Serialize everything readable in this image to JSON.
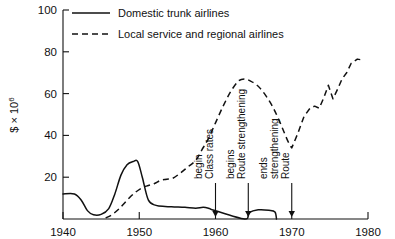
{
  "chart_data": {
    "type": "line",
    "title": "",
    "xlabel": "",
    "ylabel": "$ × 10⁶",
    "ylabel_parts": {
      "currency": "$",
      "times": "×",
      "base": "10",
      "exponent": "6"
    },
    "xlim": [
      1940,
      1980
    ],
    "ylim": [
      0,
      100
    ],
    "xticks": [
      1940,
      1950,
      1960,
      1970,
      1980
    ],
    "xtick_labels": [
      "1940",
      "1950",
      "1960",
      "1970",
      "1980"
    ],
    "yticks": [
      20,
      40,
      60,
      80,
      100
    ],
    "ytick_labels": [
      "20",
      "40",
      "60",
      "80",
      "100"
    ],
    "grid": false,
    "legend_position": "top-left-inside",
    "series": [
      {
        "name": "Domestic trunk airlines",
        "style": "solid",
        "x": [
          1940.0,
          1941.5,
          1942.4,
          1943.2,
          1944.0,
          1945.0,
          1946.0,
          1946.8,
          1947.6,
          1948.4,
          1949.2,
          1949.8,
          1950.4,
          1951.2,
          1952.2,
          1953.4,
          1954.6,
          1956.0,
          1957.4,
          1958.4,
          1959.2,
          1959.8,
          1963.8,
          1964.4,
          1965.6,
          1967.0,
          1967.8,
          1968.0
        ],
        "y": [
          12.0,
          12.0,
          9.0,
          4.0,
          2.0,
          2.2,
          5.0,
          12.0,
          21.0,
          26.0,
          27.5,
          27.5,
          20.0,
          9.0,
          6.5,
          6.0,
          5.8,
          5.6,
          5.2,
          5.6,
          5.0,
          4.2,
          0.0,
          3.0,
          4.4,
          4.2,
          3.4,
          0.0
        ]
      },
      {
        "name": "Local service and regional airlines",
        "style": "dashed",
        "x": [
          1945.6,
          1946.4,
          1947.4,
          1948.4,
          1949.4,
          1950.4,
          1951.2,
          1952.0,
          1952.8,
          1953.6,
          1954.4,
          1955.4,
          1956.4,
          1957.4,
          1958.2,
          1959.0,
          1960.0,
          1961.0,
          1962.0,
          1963.0,
          1963.8,
          1964.6,
          1965.6,
          1966.6,
          1967.6,
          1968.6,
          1969.4,
          1970.0,
          1970.8,
          1971.6,
          1972.4,
          1973.0,
          1973.6,
          1974.2,
          1974.8,
          1975.4,
          1976.0,
          1976.6,
          1977.2,
          1977.8,
          1978.6,
          1979.4
        ],
        "y": [
          0.5,
          2.0,
          5.0,
          9.0,
          12.5,
          15.0,
          16.0,
          17.0,
          18.5,
          19.0,
          19.5,
          22.0,
          25.0,
          28.0,
          33.0,
          38.0,
          46.0,
          54.0,
          61.0,
          66.0,
          67.0,
          66.0,
          63.5,
          59.0,
          53.0,
          45.0,
          38.0,
          34.0,
          41.0,
          49.0,
          53.0,
          54.0,
          53.0,
          58.0,
          64.0,
          57.5,
          62.0,
          67.0,
          70.0,
          74.5,
          76.5,
          76.0
        ]
      }
    ],
    "annotations": [
      {
        "id": "class-rates-begin",
        "lines": [
          "Class rates",
          "begin"
        ],
        "x": 1960.0,
        "arrow_to_y": 0
      },
      {
        "id": "route-strengthening-begins",
        "lines": [
          "Route strengthening",
          "begins"
        ],
        "x": 1964.3,
        "arrow_to_y": 0
      },
      {
        "id": "route-strengthening-ends",
        "lines": [
          "Route",
          "strengthening",
          "ends"
        ],
        "x": 1970.0,
        "arrow_to_y": 0
      }
    ]
  },
  "legend": {
    "items": [
      {
        "label": "Domestic trunk airlines",
        "style": "solid"
      },
      {
        "label": "Local service and regional airlines",
        "style": "dashed"
      }
    ]
  },
  "colors": {
    "ink": "#111111",
    "background": "#ffffff"
  }
}
